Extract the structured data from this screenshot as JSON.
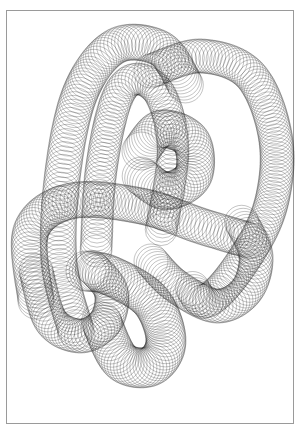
{
  "artwork": {
    "title": "Spirograph knot drawing",
    "stroke_color": "#1a1a1a",
    "paper_color": "#ffffff",
    "border_color": "#9a9a9a",
    "tubes": [
      {
        "name": "left-arch",
        "radius": 18,
        "step": 3.2,
        "points": [
          [
            75,
            330
          ],
          [
            58,
            260
          ],
          [
            62,
            170
          ],
          [
            80,
            90
          ],
          [
            115,
            45
          ],
          [
            160,
            48
          ],
          [
            185,
            85
          ]
        ]
      },
      {
        "name": "right-loop",
        "radius": 17,
        "step": 3.2,
        "points": [
          [
            150,
            70
          ],
          [
            200,
            55
          ],
          [
            250,
            75
          ],
          [
            275,
            140
          ],
          [
            268,
            210
          ],
          [
            235,
            270
          ],
          [
            205,
            300
          ],
          [
            190,
            285
          ]
        ]
      },
      {
        "name": "inner-arch",
        "radius": 16,
        "step": 3.4,
        "points": [
          [
            95,
            250
          ],
          [
            100,
            170
          ],
          [
            115,
            100
          ],
          [
            135,
            78
          ],
          [
            160,
            95
          ],
          [
            172,
            150
          ],
          [
            160,
            230
          ]
        ]
      },
      {
        "name": "center-loop",
        "radius": 19,
        "step": 3.0,
        "points": [
          [
            140,
            150
          ],
          [
            160,
            128
          ],
          [
            190,
            140
          ],
          [
            192,
            175
          ],
          [
            165,
            190
          ],
          [
            140,
            175
          ]
        ]
      },
      {
        "name": "horizontal-band",
        "radius": 18,
        "step": 3.2,
        "points": [
          [
            35,
            300
          ],
          [
            30,
            230
          ],
          [
            70,
            200
          ],
          [
            140,
            205
          ],
          [
            200,
            225
          ],
          [
            250,
            240
          ]
        ]
      },
      {
        "name": "lower-loop",
        "radius": 20,
        "step": 3.0,
        "points": [
          [
            85,
            270
          ],
          [
            110,
            275
          ],
          [
            150,
            300
          ],
          [
            165,
            340
          ],
          [
            150,
            365
          ],
          [
            120,
            360
          ],
          [
            100,
            320
          ]
        ]
      },
      {
        "name": "lower-right-curl",
        "radius": 17,
        "step": 3.2,
        "points": [
          [
            150,
            260
          ],
          [
            175,
            285
          ],
          [
            215,
            305
          ],
          [
            245,
            290
          ],
          [
            255,
            255
          ],
          [
            240,
            220
          ]
        ]
      },
      {
        "name": "left-lower-curl",
        "radius": 17,
        "step": 3.2,
        "points": [
          [
            35,
            270
          ],
          [
            50,
            320
          ],
          [
            80,
            335
          ],
          [
            105,
            320
          ],
          [
            110,
            290
          ],
          [
            90,
            265
          ]
        ]
      }
    ]
  }
}
